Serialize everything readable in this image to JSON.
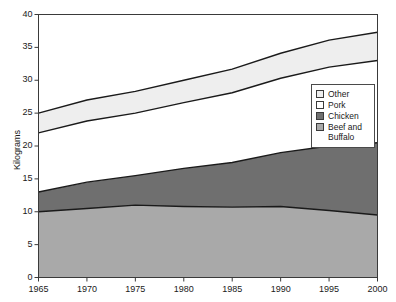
{
  "chart_data": {
    "type": "area",
    "stacked": true,
    "title": "",
    "subtitle": "",
    "xlabel": "",
    "ylabel": "Kilograms",
    "x": [
      1965,
      1970,
      1975,
      1980,
      1985,
      1990,
      1995,
      2000
    ],
    "xtick_labels": [
      "1965",
      "1970",
      "1975",
      "1980",
      "1985",
      "1990",
      "1995",
      "2000"
    ],
    "ytick_labels": [
      "0",
      "5",
      "10",
      "15",
      "20",
      "25",
      "30",
      "35",
      "40"
    ],
    "ytick_values": [
      0,
      5,
      10,
      15,
      20,
      25,
      30,
      35,
      40
    ],
    "xlim": [
      1965,
      2000
    ],
    "ylim": [
      0,
      40
    ],
    "grid": false,
    "legend_position": "top-right-inside",
    "series": [
      {
        "name": "Beef and Buffalo",
        "color": "#a9a9a9",
        "values": [
          10.0,
          10.5,
          11.0,
          10.8,
          10.7,
          10.8,
          10.2,
          9.5
        ]
      },
      {
        "name": "Chicken",
        "color": "#6f6f6f",
        "values": [
          3.0,
          4.0,
          4.5,
          5.8,
          6.8,
          8.2,
          9.8,
          11.0
        ]
      },
      {
        "name": "Pork",
        "color": "#ffffff",
        "values": [
          9.0,
          9.3,
          9.5,
          10.0,
          10.6,
          11.3,
          12.0,
          12.5
        ]
      },
      {
        "name": "Other",
        "color": "#eeeeee",
        "values": [
          3.0,
          3.2,
          3.3,
          3.4,
          3.6,
          3.8,
          4.1,
          4.3
        ]
      }
    ],
    "cumulative_tops": {
      "Beef and Buffalo": [
        10.0,
        10.5,
        11.0,
        10.8,
        10.7,
        10.8,
        10.2,
        9.5
      ],
      "Chicken": [
        13.0,
        14.5,
        15.5,
        16.6,
        17.5,
        19.0,
        20.0,
        20.5
      ],
      "Pork": [
        22.0,
        23.8,
        25.0,
        26.6,
        28.1,
        30.3,
        32.0,
        33.0
      ],
      "Other": [
        25.0,
        27.0,
        28.3,
        30.0,
        31.7,
        34.1,
        36.1,
        37.3
      ]
    },
    "legend_entries": [
      {
        "label": "Other",
        "color": "#eeeeee"
      },
      {
        "label": "Pork",
        "color": "#ffffff"
      },
      {
        "label": "Chicken",
        "color": "#6f6f6f"
      },
      {
        "label": "Beef and Buffalo",
        "color": "#a9a9a9"
      }
    ]
  },
  "legend": {
    "rows": [
      {
        "label_line1": "Other",
        "label_line2": ""
      },
      {
        "label_line1": "Pork",
        "label_line2": ""
      },
      {
        "label_line1": "Chicken",
        "label_line2": ""
      },
      {
        "label_line1": "Beef and",
        "label_line2": "Buffalo"
      }
    ]
  },
  "colors": {
    "other": "#eeeeee",
    "pork": "#ffffff",
    "chicken": "#6f6f6f",
    "beef": "#a9a9a9",
    "axis": "#3a3a3a",
    "line": "#1a1a1a",
    "text": "#1a1a1a"
  }
}
